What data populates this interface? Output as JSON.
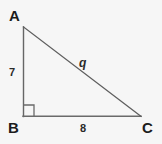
{
  "figure": {
    "type": "right-triangle-diagram",
    "background_color": "#f6f6f6",
    "stroke_color": "#666666",
    "text_color": "#1c1c1c",
    "vertices": {
      "A": {
        "label": "A",
        "x": 23,
        "y": 27
      },
      "B": {
        "label": "B",
        "x": 23,
        "y": 116
      },
      "C": {
        "label": "C",
        "x": 141,
        "y": 116
      }
    },
    "sides": {
      "vertical_leg": {
        "label": "7",
        "from": "A",
        "to": "B"
      },
      "horizontal_leg": {
        "label": "8",
        "from": "B",
        "to": "C"
      },
      "hypotenuse": {
        "label": "q",
        "from": "A",
        "to": "C"
      }
    },
    "right_angle": {
      "at": "B",
      "marker": "square",
      "size": 11
    }
  }
}
